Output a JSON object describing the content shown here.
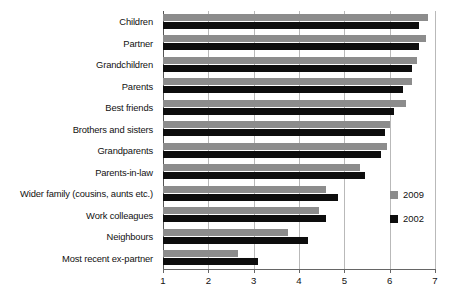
{
  "chart_data": {
    "type": "bar",
    "orientation": "horizontal",
    "title": "",
    "subtitle": "",
    "xlabel": "",
    "ylabel": "",
    "xlim": [
      1,
      7
    ],
    "xticks": [
      1,
      2,
      3,
      4,
      5,
      6,
      7
    ],
    "xtick_labels": [
      "1",
      "2",
      "3",
      "4",
      "5",
      "6",
      "7"
    ],
    "grid": true,
    "grid_axis": "x",
    "legend_position": "right-inside",
    "categories": [
      "Children",
      "Partner",
      "Grandchildren",
      "Parents",
      "Best friends",
      "Brothers and sisters",
      "Grandparents",
      "Parents-in-law",
      "Wider family (cousins, aunts etc.)",
      "Work colleagues",
      "Neighbours",
      "Most recent ex-partner"
    ],
    "series": [
      {
        "name": "2009",
        "color": "#8c8c8c",
        "values": [
          6.85,
          6.8,
          6.6,
          6.5,
          6.35,
          6.0,
          5.95,
          5.35,
          4.6,
          4.45,
          3.75,
          2.65
        ]
      },
      {
        "name": "2002",
        "color": "#0d0d0d",
        "values": [
          6.65,
          6.65,
          6.5,
          6.3,
          6.1,
          5.9,
          5.8,
          5.45,
          4.85,
          4.6,
          4.2,
          3.1
        ]
      }
    ]
  },
  "legend": {
    "items": [
      {
        "label": "2009",
        "color": "#8c8c8c"
      },
      {
        "label": "2002",
        "color": "#0d0d0d"
      }
    ]
  }
}
